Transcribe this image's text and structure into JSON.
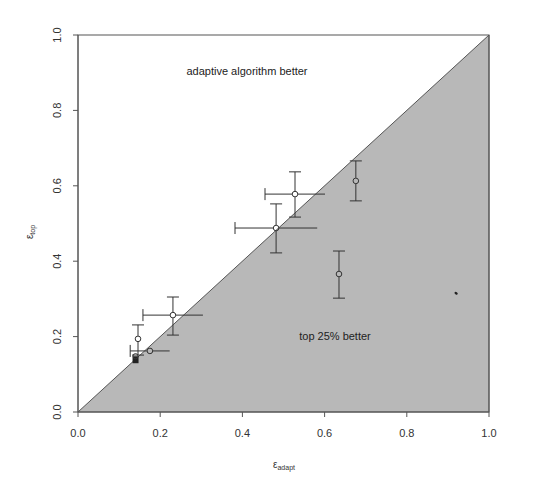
{
  "chart_data": {
    "type": "scatter",
    "title": "",
    "xlabel": "ε_adapt",
    "xlabel_main": "ε",
    "xlabel_sub": "adapt",
    "ylabel": "ε_top",
    "ylabel_main": "ε",
    "ylabel_sub": "top",
    "xlim": [
      0,
      1
    ],
    "ylim": [
      0,
      1
    ],
    "grid": false,
    "x_ticks": [
      "0.0",
      "0.2",
      "0.4",
      "0.6",
      "0.8",
      "1.0"
    ],
    "y_ticks": [
      "0.0",
      "0.2",
      "0.4",
      "0.6",
      "0.8",
      "1.0"
    ],
    "annotations": {
      "upper_region": "adaptive algorithm better",
      "lower_region": "top 25% better"
    },
    "region_fill": "#b8b8b8",
    "points": [
      {
        "x": 0.14,
        "y": 0.14,
        "filled": true
      },
      {
        "x": 0.175,
        "y": 0.162,
        "xerr_low": 0.127
      },
      {
        "x": 0.146,
        "y": 0.194,
        "yerr_low": 0.151,
        "yerr_high": 0.231
      },
      {
        "x": 0.231,
        "y": 0.257,
        "xerr_low": 0.158,
        "yerr_low": 0.204,
        "yerr_high": 0.305
      },
      {
        "x": 0.482,
        "y": 0.488,
        "xerr_low": 0.382,
        "yerr_low": 0.422,
        "yerr_high": 0.552
      },
      {
        "x": 0.528,
        "y": 0.578,
        "xerr_low": 0.455,
        "yerr_low": 0.517,
        "yerr_high": 0.637
      },
      {
        "x": 0.676,
        "y": 0.613,
        "yerr_low": 0.56,
        "yerr_high": 0.666
      },
      {
        "x": 0.635,
        "y": 0.366,
        "yerr_low": 0.302,
        "yerr_high": 0.427
      },
      {
        "x": 0.92,
        "y": 0.315,
        "speck": true
      }
    ]
  }
}
